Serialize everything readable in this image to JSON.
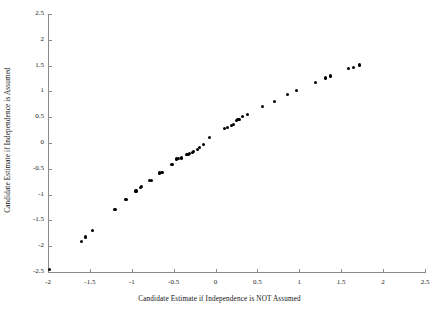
{
  "chart_data": {
    "type": "scatter",
    "title": "",
    "xlabel": "Candidate  Estimate if Independence is NOT Assumed",
    "ylabel": "Candidate Estimate if Independence is Assumed",
    "xlim": [
      -2,
      2.5
    ],
    "ylim": [
      -2.5,
      2.5
    ],
    "xticks": [
      -2,
      -1.5,
      -1,
      -0.5,
      0,
      0.5,
      1,
      1.5,
      2,
      2.5
    ],
    "xticklabels": [
      "-2",
      "-1.5",
      "-1",
      "-0.5",
      "0",
      "0.5",
      "1",
      "1.5",
      "2",
      "2.5"
    ],
    "yticks": [
      -2.5,
      -2,
      -1.5,
      -1,
      -0.5,
      0,
      0.5,
      1,
      1.5,
      2,
      2.5
    ],
    "yticklabels": [
      "-2.5",
      "-2",
      "-1.5",
      "-1",
      "-0.5",
      "0",
      "0.5",
      "1",
      "1.5",
      "2",
      "2.5"
    ],
    "grid": false,
    "legend": false,
    "marker": "filled-circle",
    "marker_color": "#000000",
    "series": [
      {
        "name": "candidate estimates",
        "points": [
          [
            -1.98,
            -2.45
          ],
          [
            -1.6,
            -1.91
          ],
          [
            -1.55,
            -1.82
          ],
          [
            -1.47,
            -1.7
          ],
          [
            -1.2,
            -1.29
          ],
          [
            -1.07,
            -1.09
          ],
          [
            -0.95,
            -0.93
          ],
          [
            -0.9,
            -0.86
          ],
          [
            -0.88,
            -0.84
          ],
          [
            -0.79,
            -0.73
          ],
          [
            -0.76,
            -0.72
          ],
          [
            -0.67,
            -0.58
          ],
          [
            -0.64,
            -0.57
          ],
          [
            -0.52,
            -0.41
          ],
          [
            -0.47,
            -0.31
          ],
          [
            -0.44,
            -0.3
          ],
          [
            -0.41,
            -0.29
          ],
          [
            -0.35,
            -0.23
          ],
          [
            -0.33,
            -0.22
          ],
          [
            -0.31,
            -0.21
          ],
          [
            -0.28,
            -0.19
          ],
          [
            -0.26,
            -0.17
          ],
          [
            -0.22,
            -0.13
          ],
          [
            -0.19,
            -0.09
          ],
          [
            -0.14,
            -0.03
          ],
          [
            -0.07,
            0.1
          ],
          [
            0.11,
            0.28
          ],
          [
            0.14,
            0.3
          ],
          [
            0.19,
            0.34
          ],
          [
            0.21,
            0.36
          ],
          [
            0.25,
            0.44
          ],
          [
            0.26,
            0.45
          ],
          [
            0.28,
            0.46
          ],
          [
            0.32,
            0.51
          ],
          [
            0.38,
            0.55
          ],
          [
            0.56,
            0.71
          ],
          [
            0.7,
            0.81
          ],
          [
            0.86,
            0.94
          ],
          [
            0.97,
            1.01
          ],
          [
            1.19,
            1.17
          ],
          [
            1.31,
            1.26
          ],
          [
            1.37,
            1.3
          ],
          [
            1.59,
            1.45
          ],
          [
            1.65,
            1.47
          ],
          [
            1.72,
            1.51
          ]
        ]
      }
    ]
  },
  "axes": {
    "x_axis_name": "x-axis",
    "y_axis_name": "y-axis"
  }
}
